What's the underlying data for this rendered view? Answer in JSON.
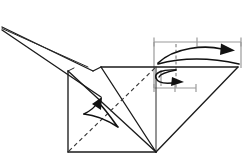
{
  "figure": {
    "kind": "origami-fold-diagram",
    "background_color": "#ffffff",
    "ink_color": "#1b1b1b",
    "measure_color": "#9a9a9a",
    "width": 249,
    "height": 165
  },
  "paper": {
    "label": "folded paper model",
    "edges": [
      {
        "name": "beak-upper-edge",
        "type": "solid",
        "points": "2,27 72,66"
      },
      {
        "name": "beak-lower-edge",
        "type": "solid",
        "points": "2,30 100,95"
      },
      {
        "name": "beak-spine-edge",
        "type": "solid",
        "points": "2,27 92,71"
      },
      {
        "name": "beak-tip-fold",
        "type": "solid",
        "points": "92,71 100,68"
      },
      {
        "name": "body-top-edge",
        "type": "solid",
        "points": "100,68 238,68"
      },
      {
        "name": "body-left-edge",
        "type": "solid",
        "points": "68,71 68,152"
      },
      {
        "name": "body-bottom-edge",
        "type": "solid",
        "points": "68,152 156,152"
      },
      {
        "name": "body-inner-vertical",
        "type": "solid",
        "points": "156,68 156,152"
      },
      {
        "name": "right-wing-upper",
        "type": "solid",
        "points": "156,152 238,68"
      },
      {
        "name": "body-left-top-edge",
        "type": "solid",
        "points": "68,71 100,68"
      }
    ],
    "creases": [
      {
        "name": "crease-left-diagonal-solid",
        "type": "solid",
        "points": "68,71 156,152"
      },
      {
        "name": "crease-right-diagonal-solid",
        "type": "solid",
        "points": "100,68 156,152"
      },
      {
        "name": "crease-valley-dashed",
        "type": "dashed",
        "points": "68,152 156,68"
      }
    ]
  },
  "arrows": [
    {
      "name": "large-fold-over-arrow",
      "direction": "right",
      "style": "curved-double-line",
      "description": "long curved arrow sweeping right over the top band"
    },
    {
      "name": "small-fold-and-return-arrow",
      "direction": "right",
      "style": "curved-u-turn",
      "description": "short U-shaped fold-and-unfold arrow below the band"
    },
    {
      "name": "valley-fold-arrow-left",
      "direction": "up-left",
      "style": "curved-double-line",
      "description": "curved arrow over the left panel pointing up-left along the crease"
    }
  ],
  "measurements": {
    "top_rule": {
      "name": "top-measure-rule",
      "y": 42,
      "x_start": 154,
      "x_end": 241,
      "ticks": [
        154,
        197,
        241
      ],
      "segments": 2,
      "note": "equal division guide"
    },
    "bottom_rule": {
      "name": "bottom-measure-rule",
      "y": 88,
      "x_start": 154,
      "x_end": 196,
      "ticks": [
        154,
        175,
        196
      ],
      "segments": 2,
      "note": "equal division guide"
    },
    "vertical_guide": {
      "name": "vertical-measure-guide",
      "x": 176,
      "y_start": 42,
      "y_end": 88,
      "type": "dashed"
    },
    "vertical_guide_short": {
      "name": "vertical-measure-guide-short",
      "x": 154,
      "y_start": 42,
      "y_end": 88,
      "type": "solid-light"
    }
  }
}
